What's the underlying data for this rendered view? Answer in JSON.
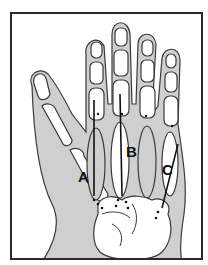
{
  "figure": {
    "labels": {
      "a": "A",
      "b": "B",
      "c": "C"
    },
    "colors": {
      "soft_tissue": "#cfcfcf",
      "outline": "#3a3a3a",
      "bone": "#ffffff",
      "frame": "#2a2a2a"
    }
  }
}
